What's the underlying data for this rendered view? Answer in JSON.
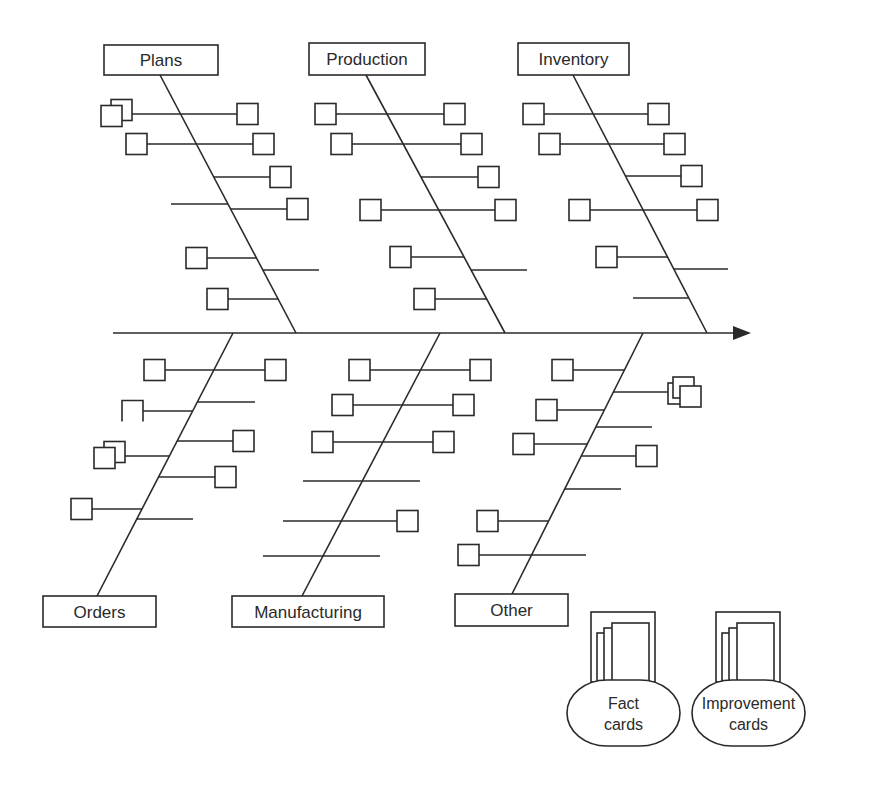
{
  "diagram": {
    "type": "fishbone (cause-and-effect) diagram",
    "spine": {
      "x1": 113,
      "y": 333,
      "x2": 735,
      "arrow_tip": 751
    },
    "categories": [
      {
        "id": "plans",
        "label": "Plans",
        "position": "top",
        "label_box": {
          "x": 104,
          "y": 45,
          "w": 114,
          "h": 30
        },
        "bone": {
          "x1": 160,
          "y1": 75,
          "x2": 296,
          "y2": 333
        },
        "ribs": [
          {
            "y": 114,
            "left": 130,
            "right": 237,
            "left_box": "stacked",
            "right_box": true
          },
          {
            "y": 144,
            "left": 147,
            "right": 253,
            "left_box": true,
            "right_box": true
          },
          {
            "y": 177,
            "left": null,
            "right": 270,
            "left_box": false,
            "right_box": true
          },
          {
            "y": 204,
            "left": 171,
            "right": null,
            "left_box": false,
            "right_box": false
          },
          {
            "y": 209,
            "left": null,
            "right": 287,
            "left_box": false,
            "right_box": true
          },
          {
            "y": 258,
            "left": 207,
            "right": null,
            "left_box": true,
            "right_box": false
          },
          {
            "y": 270,
            "left": null,
            "right": 319,
            "left_box": false,
            "right_box": false
          },
          {
            "y": 299,
            "left": 228,
            "right": null,
            "left_box": true,
            "right_box": false
          }
        ]
      },
      {
        "id": "production",
        "label": "Production",
        "position": "top",
        "label_box": {
          "x": 309,
          "y": 43,
          "w": 116,
          "h": 32
        },
        "bone": {
          "x1": 366,
          "y1": 75,
          "x2": 505,
          "y2": 333
        },
        "ribs": [
          {
            "y": 114,
            "left": 336,
            "right": 444,
            "left_box": true,
            "right_box": true
          },
          {
            "y": 144,
            "left": 352,
            "right": 461,
            "left_box": true,
            "right_box": true
          },
          {
            "y": 177,
            "left": null,
            "right": 478,
            "left_box": false,
            "right_box": true
          },
          {
            "y": 210,
            "left": 381,
            "right": 495,
            "left_box": true,
            "right_box": true
          },
          {
            "y": 257,
            "left": 411,
            "right": null,
            "left_box": true,
            "right_box": false
          },
          {
            "y": 270,
            "left": null,
            "right": 527,
            "left_box": false,
            "right_box": false
          },
          {
            "y": 299,
            "left": 435,
            "right": null,
            "left_box": true,
            "right_box": false
          }
        ]
      },
      {
        "id": "inventory",
        "label": "Inventory",
        "position": "top",
        "label_box": {
          "x": 518,
          "y": 43,
          "w": 111,
          "h": 32
        },
        "bone": {
          "x1": 573,
          "y1": 75,
          "x2": 707,
          "y2": 333
        },
        "ribs": [
          {
            "y": 114,
            "left": 544,
            "right": 648,
            "left_box": true,
            "right_box": true
          },
          {
            "y": 144,
            "left": 560,
            "right": 664,
            "left_box": true,
            "right_box": true
          },
          {
            "y": 176,
            "left": null,
            "right": 681,
            "left_box": false,
            "right_box": true
          },
          {
            "y": 210,
            "left": 590,
            "right": 697,
            "left_box": true,
            "right_box": true
          },
          {
            "y": 257,
            "left": 617,
            "right": null,
            "left_box": true,
            "right_box": false
          },
          {
            "y": 269,
            "left": null,
            "right": 728,
            "left_box": false,
            "right_box": false
          },
          {
            "y": 298,
            "left": 633,
            "right": null,
            "left_box": false,
            "right_box": false
          }
        ]
      },
      {
        "id": "orders",
        "label": "Orders",
        "position": "bottom",
        "label_box": {
          "x": 43,
          "y": 596,
          "w": 113,
          "h": 31
        },
        "bone": {
          "x1": 233,
          "y1": 333,
          "x2": 97,
          "y2": 596
        },
        "ribs": [
          {
            "y": 370,
            "left": 165,
            "right": 265,
            "left_box": true,
            "right_box": true
          },
          {
            "y": 402,
            "left": null,
            "right": 255,
            "left_box": false,
            "right_box": false
          },
          {
            "y": 411,
            "left": 143,
            "right": null,
            "left_box": "partial",
            "right_box": false
          },
          {
            "y": 441,
            "left": null,
            "right": 233,
            "left_box": false,
            "right_box": true
          },
          {
            "y": 456,
            "left": 123,
            "right": null,
            "left_box": "stacked",
            "right_box": false
          },
          {
            "y": 477,
            "left": null,
            "right": 215,
            "left_box": false,
            "right_box": true
          },
          {
            "y": 509,
            "left": 92,
            "right": null,
            "left_box": true,
            "right_box": false
          },
          {
            "y": 519,
            "left": null,
            "right": 193,
            "left_box": false,
            "right_box": false
          }
        ]
      },
      {
        "id": "manufacturing",
        "label": "Manufacturing",
        "position": "bottom",
        "label_box": {
          "x": 232,
          "y": 596,
          "w": 152,
          "h": 31
        },
        "bone": {
          "x1": 440,
          "y1": 333,
          "x2": 302,
          "y2": 596
        },
        "ribs": [
          {
            "y": 370,
            "left": 370,
            "right": 470,
            "left_box": true,
            "right_box": true
          },
          {
            "y": 405,
            "left": 353,
            "right": 453,
            "left_box": true,
            "right_box": true
          },
          {
            "y": 442,
            "left": 333,
            "right": 433,
            "left_box": true,
            "right_box": true
          },
          {
            "y": 481,
            "left": 303,
            "right": 420,
            "left_box": false,
            "right_box": false
          },
          {
            "y": 521,
            "left": 283,
            "right": 397,
            "left_box": false,
            "right_box": true
          },
          {
            "y": 556,
            "left": 263,
            "right": 380,
            "left_box": false,
            "right_box": false
          }
        ]
      },
      {
        "id": "other",
        "label": "Other",
        "position": "bottom",
        "label_box": {
          "x": 455,
          "y": 594,
          "w": 113,
          "h": 32
        },
        "bone": {
          "x1": 643,
          "y1": 333,
          "x2": 511,
          "y2": 596
        },
        "ribs": [
          {
            "y": 370,
            "left": 573,
            "right": null,
            "left_box": true,
            "right_box": false
          },
          {
            "y": 392,
            "left": null,
            "right": 668,
            "left_box": false,
            "right_box": "stacked"
          },
          {
            "y": 410,
            "left": 557,
            "right": null,
            "left_box": true,
            "right_box": false
          },
          {
            "y": 427,
            "left": null,
            "right": 652,
            "left_box": false,
            "right_box": false
          },
          {
            "y": 444,
            "left": 534,
            "right": null,
            "left_box": true,
            "right_box": false
          },
          {
            "y": 456,
            "left": null,
            "right": 636,
            "left_box": false,
            "right_box": true
          },
          {
            "y": 489,
            "left": null,
            "right": 621,
            "left_box": false,
            "right_box": false
          },
          {
            "y": 521,
            "left": 498,
            "right": null,
            "left_box": true,
            "right_box": false
          },
          {
            "y": 555,
            "left": 479,
            "right": 586,
            "left_box": true,
            "right_box": false
          }
        ]
      }
    ],
    "card_holders": [
      {
        "id": "fact-cards",
        "line1": "Fact",
        "line2": "cards",
        "x": 567,
        "y": 612
      },
      {
        "id": "improvement-cards",
        "line1": "Improvement",
        "line2": "cards",
        "x": 692,
        "y": 612
      }
    ]
  }
}
